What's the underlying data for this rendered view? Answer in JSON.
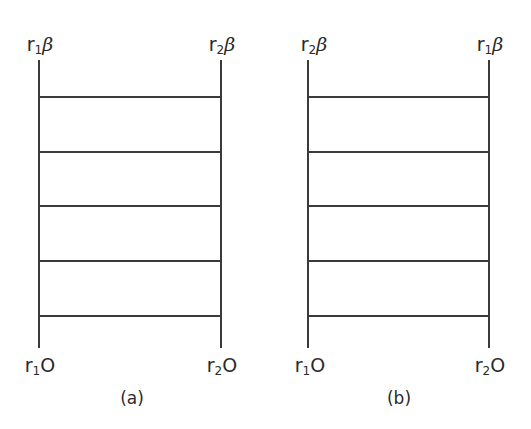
{
  "diagrams": [
    {
      "id": "a",
      "caption": "(a)",
      "left_x": 39,
      "right_x": 221,
      "top_labels": {
        "left": {
          "r": "r",
          "sub": "1",
          "sym": "β"
        },
        "right": {
          "r": "r",
          "sub": "2",
          "sym": "β"
        }
      },
      "bottom_labels": {
        "left": {
          "r": "r",
          "sub": "1",
          "sym": "O"
        },
        "right": {
          "r": "r",
          "sub": "2",
          "sym": "O"
        }
      },
      "rungs_y": [
        97,
        152,
        206,
        261,
        316
      ]
    },
    {
      "id": "b",
      "caption": "(b)",
      "left_x": 308,
      "right_x": 488,
      "top_labels": {
        "left": {
          "r": "r",
          "sub": "2",
          "sym": "β"
        },
        "right": {
          "r": "r",
          "sub": "1",
          "sym": "β"
        }
      },
      "bottom_labels": {
        "left": {
          "r": "r",
          "sub": "1",
          "sym": "O"
        },
        "right": {
          "r": "r",
          "sub": "2",
          "sym": "O"
        }
      },
      "rungs_y": [
        97,
        152,
        206,
        261,
        316
      ]
    }
  ],
  "line_top_y": 60,
  "line_bottom_y": 348
}
